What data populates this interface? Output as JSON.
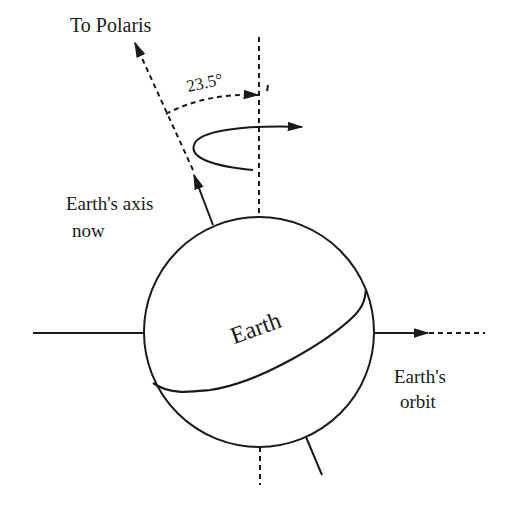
{
  "diagram": {
    "labels": {
      "polaris": "To Polaris",
      "angle": "23.5°",
      "axis_line1": "Earth's axis",
      "axis_line2": "now",
      "earth": "Earth",
      "orbit_line1": "Earth's",
      "orbit_line2": "orbit"
    },
    "values": {
      "tilt_degrees": 23.5
    },
    "colors": {
      "stroke": "#1a1a1a",
      "background": "#ffffff"
    }
  }
}
